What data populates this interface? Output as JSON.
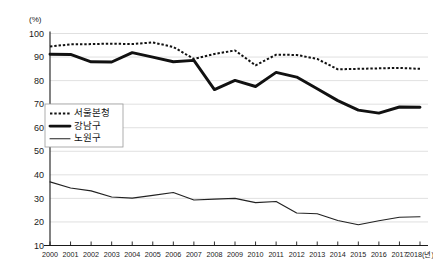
{
  "chart_data": {
    "type": "line",
    "title": "",
    "xlabel": "(년)",
    "ylabel": "",
    "unit_label": "(%)",
    "grid": true,
    "legend_position": "inner-left",
    "ylim": [
      10,
      100
    ],
    "ytick_step": 10,
    "ytick_labels": [
      "100",
      "90",
      "80",
      "70",
      "60",
      "50",
      "40",
      "30",
      "20",
      "10"
    ],
    "categories": [
      "2000",
      "2001",
      "2002",
      "2003",
      "2004",
      "2005",
      "2006",
      "2007",
      "2008",
      "2009",
      "2010",
      "2011",
      "2012",
      "2013",
      "2014",
      "2015",
      "2016",
      "2017",
      "2018"
    ],
    "x_axis_suffix": "(년)",
    "series": [
      {
        "name": "서울본청",
        "style": "dotted",
        "color": "#111111",
        "values": [
          94.5,
          95.4,
          95.5,
          95.7,
          95.5,
          96.2,
          94.3,
          89.2,
          91.3,
          92.8,
          86.5,
          91.0,
          90.9,
          89.2,
          84.8,
          85.0,
          85.2,
          85.4,
          85.0
        ]
      },
      {
        "name": "강남구",
        "style": "solid-thick",
        "color": "#111111",
        "values": [
          91.2,
          91.1,
          88.0,
          87.9,
          91.9,
          90.0,
          88.0,
          88.6,
          76.2,
          80.1,
          77.5,
          83.5,
          81.5,
          76.5,
          71.5,
          67.5,
          66.2,
          68.8,
          68.7
        ]
      },
      {
        "name": "노원구",
        "style": "solid-thin",
        "color": "#222222",
        "values": [
          37.0,
          34.4,
          33.2,
          30.6,
          30.1,
          31.3,
          32.5,
          29.3,
          29.7,
          30.0,
          28.2,
          28.7,
          23.8,
          23.5,
          20.6,
          18.8,
          20.5,
          22.0,
          22.2
        ]
      }
    ]
  },
  "legend": {
    "items": [
      {
        "label": "서울본청",
        "style": "dotted"
      },
      {
        "label": "강남구",
        "style": "solid-thick"
      },
      {
        "label": "노원구",
        "style": "solid-thin"
      }
    ]
  }
}
